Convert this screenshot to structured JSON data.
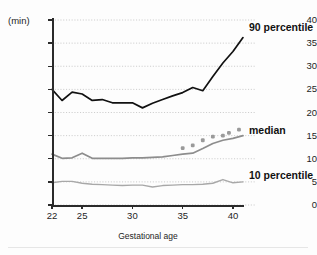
{
  "figure": {
    "unit_label": "(min)",
    "x_axis_title": "Gestational age"
  },
  "axes": {
    "y_ticks": [
      0,
      5,
      10,
      15,
      20,
      25,
      30,
      35,
      40
    ],
    "x_ticks": [
      22,
      25,
      30,
      35,
      40
    ]
  },
  "labels": {
    "p90": "90 percentile",
    "median": "median",
    "p10": "10 percentile"
  },
  "chart_data": {
    "type": "line",
    "title": "",
    "xlabel": "Gestational age",
    "ylabel": "(min)",
    "xlim": [
      22,
      41
    ],
    "ylim": [
      0,
      40
    ],
    "grid": true,
    "legend_position": "right-inline",
    "x": [
      22,
      23,
      24,
      25,
      26,
      27,
      28,
      29,
      30,
      31,
      32,
      33,
      34,
      35,
      36,
      37,
      38,
      39,
      40,
      41
    ],
    "series": [
      {
        "name": "90 percentile",
        "color": "#111111",
        "style": "solid",
        "values": [
          25.0,
          22.6,
          24.4,
          24.0,
          22.6,
          22.8,
          22.1,
          22.1,
          22.1,
          21.0,
          22.0,
          22.8,
          23.6,
          24.3,
          25.4,
          24.7,
          27.8,
          30.7,
          33.2,
          36.2
        ]
      },
      {
        "name": "median",
        "color": "#8d8d8d",
        "style": "solid",
        "values": [
          11.0,
          10.1,
          10.2,
          11.2,
          10.1,
          10.1,
          10.1,
          10.1,
          10.2,
          10.2,
          10.3,
          10.4,
          10.7,
          11.0,
          11.2,
          12.2,
          13.3,
          14.0,
          14.4,
          15.0
        ]
      },
      {
        "name": "10 percentile",
        "color": "#a8a8a8",
        "style": "solid",
        "values": [
          4.8,
          5.1,
          5.1,
          4.7,
          4.5,
          4.4,
          4.3,
          4.2,
          4.3,
          4.3,
          3.9,
          4.2,
          4.3,
          4.4,
          4.4,
          4.5,
          4.7,
          5.5,
          4.8,
          5.0
        ]
      }
    ],
    "scatter": {
      "name": "median observations",
      "color": "#9a9a9a",
      "x": [
        35,
        36,
        37,
        38,
        39,
        39.6,
        40.6
      ],
      "y": [
        12.3,
        12.9,
        14.0,
        14.8,
        15.0,
        15.6,
        16.3
      ]
    }
  }
}
